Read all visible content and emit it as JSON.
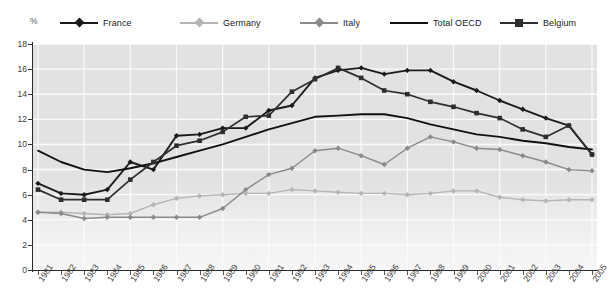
{
  "axis": {
    "y_unit": "%",
    "y_ticks": [
      0,
      2,
      4,
      6,
      8,
      10,
      12,
      14,
      16,
      18
    ],
    "y_min": 0,
    "y_max": 18
  },
  "legend": [
    {
      "name": "France",
      "color": "#1a1a1a",
      "marker": "diamond",
      "x": 60
    },
    {
      "name": "Germany",
      "color": "#b5b5b5",
      "marker": "diamond",
      "x": 180
    },
    {
      "name": "Italy",
      "color": "#8a8a8a",
      "marker": "diamond",
      "x": 300
    },
    {
      "name": "Total OECD",
      "color": "#111111",
      "marker": "none",
      "x": 390
    },
    {
      "name": "Belgium",
      "color": "#2e2e2e",
      "marker": "square",
      "x": 500
    }
  ],
  "chart_data": {
    "type": "line",
    "title": "",
    "xlabel": "",
    "ylabel": "%",
    "ylim": [
      0,
      18
    ],
    "grid": true,
    "legend_position": "top",
    "x": [
      1981,
      1982,
      1983,
      1984,
      1985,
      1986,
      1987,
      1988,
      1989,
      1990,
      1991,
      1992,
      1993,
      1994,
      1995,
      1996,
      1997,
      1998,
      1999,
      2000,
      2001,
      2002,
      2003,
      2004,
      2005
    ],
    "series": [
      {
        "name": "France",
        "color": "#1a1a1a",
        "marker": "diamond",
        "values": [
          6.9,
          6.1,
          6.0,
          6.4,
          8.6,
          8.0,
          10.7,
          10.8,
          11.3,
          11.3,
          12.7,
          13.1,
          15.3,
          15.9,
          16.1,
          15.6,
          15.9,
          15.9,
          15.0,
          14.3,
          13.5,
          12.8,
          12.1,
          11.5,
          9.2
        ]
      },
      {
        "name": "Germany",
        "color": "#b5b5b5",
        "marker": "diamond",
        "values": [
          4.6,
          4.6,
          4.5,
          4.4,
          4.5,
          5.2,
          5.7,
          5.9,
          6.0,
          6.1,
          6.1,
          6.4,
          6.3,
          6.2,
          6.1,
          6.1,
          6.0,
          6.1,
          6.3,
          6.3,
          5.8,
          5.6,
          5.5,
          5.6,
          5.6
        ]
      },
      {
        "name": "Italy",
        "color": "#8a8a8a",
        "marker": "diamond",
        "values": [
          4.6,
          4.5,
          4.1,
          4.2,
          4.2,
          4.2,
          4.2,
          4.2,
          4.9,
          6.4,
          7.6,
          8.1,
          9.5,
          9.7,
          9.1,
          8.4,
          9.7,
          10.6,
          10.2,
          9.7,
          9.6,
          9.1,
          8.6,
          8.0,
          7.9
        ]
      },
      {
        "name": "Total OECD",
        "color": "#111111",
        "marker": "none",
        "values": [
          9.5,
          8.6,
          8.0,
          7.8,
          8.1,
          8.5,
          9.0,
          9.5,
          10.0,
          10.6,
          11.2,
          11.7,
          12.2,
          12.3,
          12.4,
          12.4,
          12.1,
          11.6,
          11.2,
          10.8,
          10.6,
          10.3,
          10.1,
          9.8,
          9.6
        ]
      },
      {
        "name": "Belgium",
        "color": "#2e2e2e",
        "marker": "square",
        "values": [
          6.4,
          5.6,
          5.6,
          5.6,
          7.2,
          8.6,
          9.9,
          10.3,
          11.0,
          12.2,
          12.3,
          14.2,
          15.2,
          16.1,
          15.3,
          14.3,
          14.0,
          13.4,
          13.0,
          12.5,
          12.1,
          11.2,
          10.6,
          11.5,
          9.2
        ]
      }
    ]
  }
}
